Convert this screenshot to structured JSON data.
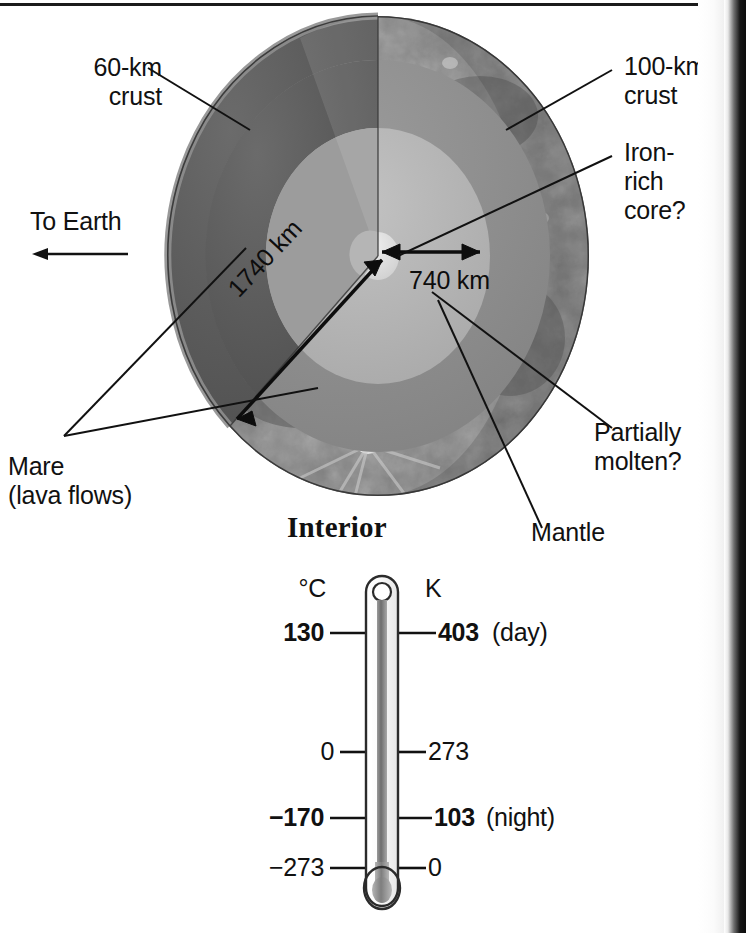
{
  "figure": {
    "title": "Interior"
  },
  "labels": {
    "crust_near": "60-km\ncrust",
    "crust_far": "100-km\ncrust",
    "core": "Iron-\nrich\ncore?",
    "to_earth": "To Earth",
    "mare": "Mare\n(lava flows)",
    "partially_molten": "Partially\nmolten?",
    "mantle": "Mantle"
  },
  "dimensions": {
    "radius_total": "1740 km",
    "core_radius": "740 km"
  },
  "thermometer": {
    "left_scale_header": "°C",
    "right_scale_header": "K",
    "readings": [
      {
        "celsius": "130",
        "kelvin": "403",
        "note": "(day)",
        "bold": true,
        "y": 63
      },
      {
        "celsius": "0",
        "kelvin": "273",
        "note": "",
        "bold": false,
        "y": 182
      },
      {
        "celsius": "−170",
        "kelvin": "103",
        "note": "(night)",
        "bold": true,
        "y": 248
      },
      {
        "celsius": "−273",
        "kelvin": "0",
        "note": "",
        "bold": false,
        "y": 298
      }
    ]
  },
  "colors": {
    "crust_outer": "#6e6e6e",
    "mantle_dark": "#555555",
    "mantle_mid": "#8d8d8d",
    "mantle_light": "#b3b3b3",
    "core": "#d9d9d9",
    "line": "#111111",
    "page_edge": "#141414"
  }
}
